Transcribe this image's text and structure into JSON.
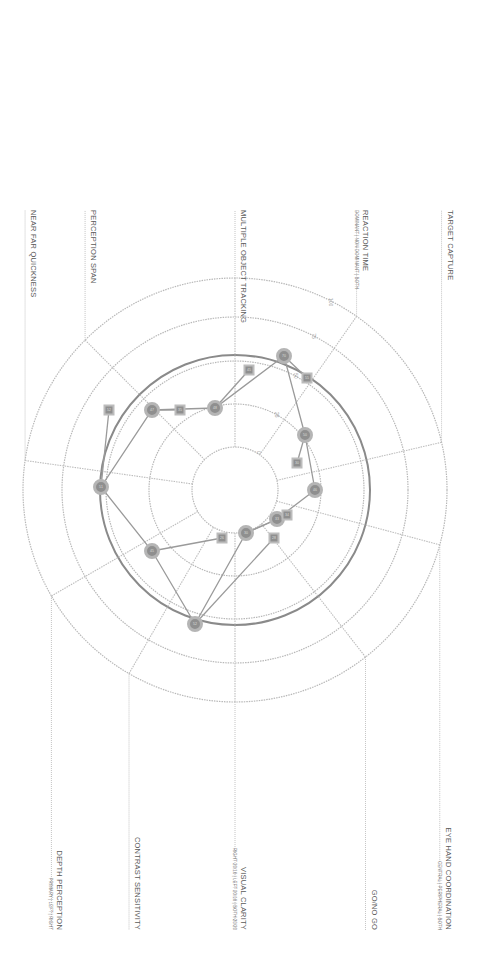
{
  "chart_data": {
    "type": "radar",
    "orientation": "rotated 90 degrees clockwise",
    "center": [
      235,
      490
    ],
    "scale": {
      "ticks": [
        0,
        25,
        50,
        75,
        100
      ],
      "tick_labels": [
        "0",
        "25",
        "50",
        "75",
        "100"
      ],
      "radii": [
        43,
        86,
        129,
        173,
        212
      ],
      "highlight_ring_value": 50
    },
    "axes": [
      {
        "name": "VISUAL CLARITY",
        "sub": "RIGHT 20/16 | LEFT 20/16 | BOTH 20/20",
        "angle": 0
      },
      {
        "name": "CONTRAST SENSITIVITY",
        "angle": 30
      },
      {
        "name": "DEPTH PERCEPTION",
        "sub": "PRIMARY | LEFT | RIGHT",
        "angle": 60
      },
      {
        "name": "NEAR FAR QUICKNESS",
        "angle": 98
      },
      {
        "name": "PERCEPTION SPAN",
        "angle": 135
      },
      {
        "name": "MULTIPLE OBJECT TRACKING",
        "angle": 180
      },
      {
        "name": "REACTION TIME",
        "sub": "DOMINANT | NON DOMINANT | BOTH",
        "angle": 215
      },
      {
        "name": "TARGET CAPTURE",
        "angle": 257
      },
      {
        "name": "EYE HAND COORDINATION",
        "sub": "CENTRAL | PERIPHERAL | BOTH",
        "angle": 285
      },
      {
        "name": "GO/NO GO",
        "angle": 322
      }
    ],
    "series": [
      {
        "name": "score",
        "marker": "circle",
        "points": [
          {
            "x": 315,
            "y": 490,
            "label": "46"
          },
          {
            "x": 305,
            "y": 435,
            "label": "50"
          },
          {
            "x": 284,
            "y": 356,
            "label": "70"
          },
          {
            "x": 215,
            "y": 408,
            "label": "48"
          },
          {
            "x": 152,
            "y": 410,
            "label": "47"
          },
          {
            "x": 101,
            "y": 487,
            "label": "51"
          },
          {
            "x": 152,
            "y": 551,
            "label": "45"
          },
          {
            "x": 195,
            "y": 624,
            "label": "52"
          },
          {
            "x": 246,
            "y": 533,
            "label": "30"
          },
          {
            "x": 277,
            "y": 519,
            "label": "33"
          }
        ]
      },
      {
        "name": "secondary",
        "marker": "square",
        "points": [
          {
            "x": 297,
            "y": 463,
            "label": "30"
          },
          {
            "x": 307,
            "y": 378,
            "label": "55"
          },
          {
            "x": 249,
            "y": 370,
            "label": "45"
          },
          {
            "x": 180,
            "y": 410,
            "label": "35"
          },
          {
            "x": 109,
            "y": 410,
            "label": "52"
          },
          {
            "x": 222,
            "y": 538,
            "label": "26"
          },
          {
            "x": 274,
            "y": 538,
            "label": "28"
          },
          {
            "x": 287,
            "y": 515,
            "label": "34"
          }
        ]
      }
    ],
    "path_order": [
      0,
      1,
      2,
      3,
      4,
      5,
      6,
      7,
      8,
      9,
      0
    ]
  }
}
